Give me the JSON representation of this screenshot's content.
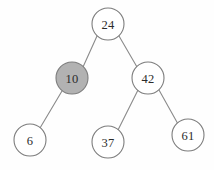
{
  "figure": {
    "background_color": "#fefefe",
    "width": 214,
    "height": 170
  },
  "style": {
    "node_radius": 16,
    "node_fill_default": "#ffffff",
    "node_fill_highlight": "#b2b2b2",
    "node_stroke": "#7d7d7d",
    "edge_stroke": "#8a8a8a",
    "label_color": "#2b2b2b"
  },
  "chart_data": {
    "type": "diagram",
    "diagram_kind": "binary-search-tree",
    "title": "",
    "nodes": [
      {
        "id": "n24",
        "label": "24",
        "cx": 108,
        "cy": 24,
        "r": 16,
        "highlighted": false,
        "fill": "#ffffff"
      },
      {
        "id": "n10",
        "label": "10",
        "cx": 72,
        "cy": 78,
        "r": 16,
        "highlighted": true,
        "fill": "#b2b2b2"
      },
      {
        "id": "n42",
        "label": "42",
        "cx": 148,
        "cy": 78,
        "r": 16,
        "highlighted": false,
        "fill": "#ffffff"
      },
      {
        "id": "n6",
        "label": "6",
        "cx": 30,
        "cy": 140,
        "r": 16,
        "highlighted": false,
        "fill": "#ffffff"
      },
      {
        "id": "n37",
        "label": "37",
        "cx": 108,
        "cy": 142,
        "r": 16,
        "highlighted": false,
        "fill": "#ffffff"
      },
      {
        "id": "n61",
        "label": "61",
        "cx": 188,
        "cy": 135,
        "r": 16,
        "highlighted": false,
        "fill": "#ffffff"
      }
    ],
    "edges": [
      {
        "id": "e24-10",
        "from": "n24",
        "to": "n10",
        "x1": 97,
        "y1": 36,
        "x2": 83,
        "y2": 67
      },
      {
        "id": "e24-42",
        "from": "n24",
        "to": "n42",
        "x1": 119,
        "y1": 36,
        "x2": 137,
        "y2": 67
      },
      {
        "id": "e10-6",
        "from": "n10",
        "to": "n6",
        "x1": 62,
        "y1": 91,
        "x2": 40,
        "y2": 128
      },
      {
        "id": "e42-37",
        "from": "n42",
        "to": "n37",
        "x1": 138,
        "y1": 90,
        "x2": 118,
        "y2": 130
      },
      {
        "id": "e42-61",
        "from": "n42",
        "to": "n61",
        "x1": 159,
        "y1": 90,
        "x2": 178,
        "y2": 124
      }
    ],
    "labels": [
      "24",
      "10",
      "42",
      "6",
      "37",
      "61"
    ],
    "highlighted_nodes": [
      "10"
    ]
  }
}
